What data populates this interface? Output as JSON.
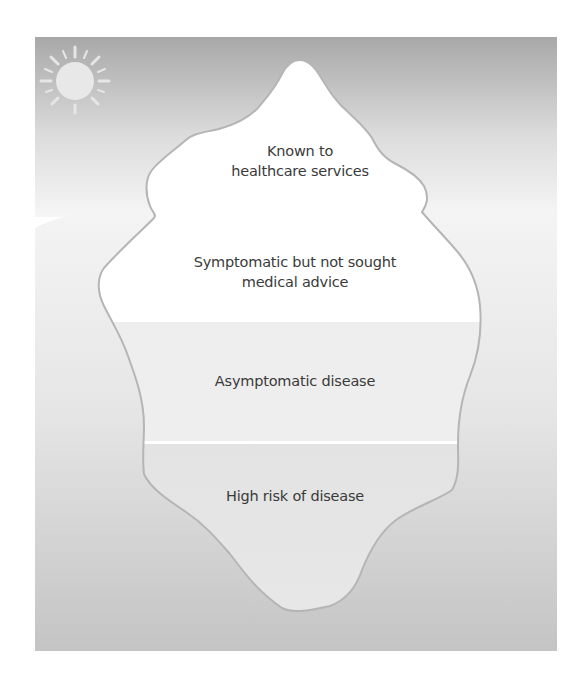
{
  "diagram": {
    "type": "iceberg",
    "icons": {
      "sun": "sun-icon"
    },
    "layers": [
      {
        "id": "known",
        "lines": [
          "Known to",
          "healthcare services"
        ]
      },
      {
        "id": "symptomatic",
        "lines": [
          "Symptomatic but not sought",
          "medical advice"
        ]
      },
      {
        "id": "asymptomatic",
        "lines": [
          "Asymptomatic disease"
        ]
      },
      {
        "id": "high-risk",
        "lines": [
          "High risk of disease"
        ]
      }
    ],
    "colors": {
      "sky_top": "#a9a9a9",
      "sky_bottom": "#f4f4f4",
      "water_top": "#f2f2f2",
      "water_bottom": "#c2c2c2",
      "ice_top": "#ffffff",
      "ice_asymptomatic": "#eeeeee",
      "ice_high_risk": "#e0e0e0",
      "outline": "#b5b5b5",
      "text": "#3a3a3a"
    }
  }
}
